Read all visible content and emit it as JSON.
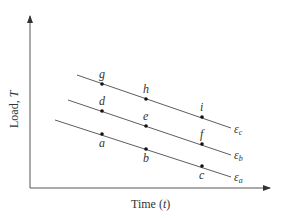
{
  "diagram": {
    "x_axis_label": "Time (t)",
    "x_axis_label_main": "Time (",
    "x_axis_label_var": "t",
    "x_axis_label_close": ")",
    "y_axis_label": "Load, T",
    "y_axis_label_main": "Load, ",
    "y_axis_label_var": "T",
    "colors": {
      "line": "#333333",
      "axis": "#555555",
      "text": "#333333"
    },
    "lines": [
      {
        "id": "eps_a",
        "label_base": "ε",
        "label_sub": "a",
        "points": [
          "a",
          "b",
          "c"
        ]
      },
      {
        "id": "eps_b",
        "label_base": "ε",
        "label_sub": "b",
        "points": [
          "d",
          "e",
          "f"
        ]
      },
      {
        "id": "eps_c",
        "label_base": "ε",
        "label_sub": "c",
        "points": [
          "g",
          "h",
          "i"
        ]
      }
    ],
    "point_labels": {
      "a": "a",
      "b": "b",
      "c": "c",
      "d": "d",
      "e": "e",
      "f": "f",
      "g": "g",
      "h": "h",
      "i": "i"
    }
  }
}
